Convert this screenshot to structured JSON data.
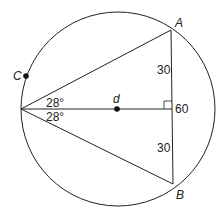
{
  "diagram": {
    "points": {
      "A": "A",
      "B": "B",
      "C": "C",
      "center": "d"
    },
    "angles": {
      "upper": "28°",
      "lower": "28°"
    },
    "segments": {
      "upper_half": "30",
      "lower_half": "30",
      "chord_total": "60"
    },
    "colors": {
      "stroke": "#222222",
      "background": "#ffffff"
    }
  }
}
